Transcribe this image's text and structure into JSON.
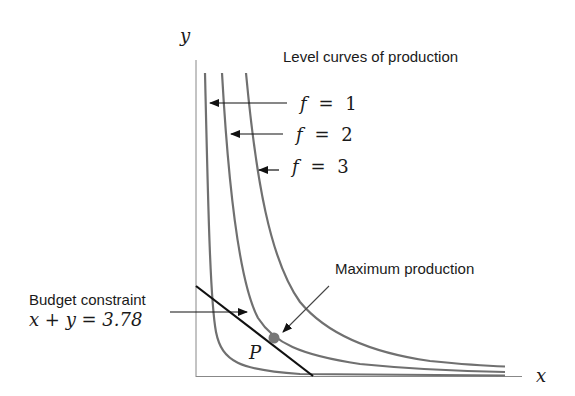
{
  "diagram": {
    "title": "Level curves of production",
    "axes": {
      "x_label": "x",
      "y_label": "y"
    },
    "level_curves": [
      {
        "label_var": "f",
        "label_eq": "=",
        "label_val": "1",
        "color": "#707070"
      },
      {
        "label_var": "f",
        "label_eq": "=",
        "label_val": "2",
        "color": "#707070"
      },
      {
        "label_var": "f",
        "label_eq": "=",
        "label_val": "3",
        "color": "#707070"
      }
    ],
    "budget": {
      "label": "Budget constraint",
      "equation": "x + y = 3.78",
      "color": "#111111"
    },
    "point": {
      "label": "P",
      "annotation": "Maximum production",
      "color": "#777777"
    }
  }
}
